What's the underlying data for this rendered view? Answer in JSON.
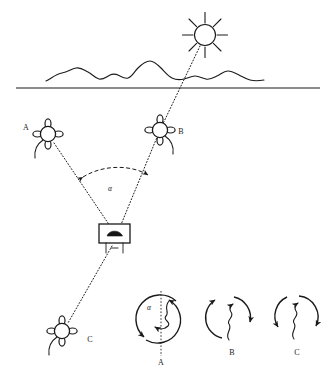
{
  "figure": {
    "background_color": "#ffffff",
    "ink_color": "#1a1a1a",
    "width": 335,
    "height": 376
  },
  "scene": {
    "sun": {
      "name": "sun",
      "label": "",
      "cx": 205,
      "cy": 35,
      "radius": 10.5,
      "ray_count": 8,
      "ray_length": 11
    },
    "horizon": {
      "name": "horizon-line",
      "y": 88,
      "x_start": 16,
      "x_end": 320
    },
    "terrain": {
      "name": "mountain-silhouette",
      "x_start": 46,
      "x_end": 264,
      "base_y": 80
    },
    "detector": {
      "name": "detector-device",
      "label": "",
      "x": 99,
      "y": 224,
      "width": 31,
      "height": 19
    }
  },
  "organisms": [
    {
      "id": "A",
      "label": "A",
      "cx": 48,
      "cy": 134,
      "label_x": 26,
      "label_y": 130,
      "tail_dir": "left"
    },
    {
      "id": "B",
      "label": "B",
      "cx": 160,
      "cy": 130,
      "label_x": 180,
      "label_y": 134,
      "tail_dir": "right"
    },
    {
      "id": "C",
      "label": "C",
      "cx": 62,
      "cy": 331,
      "label_x": 90,
      "label_y": 342,
      "tail_dir": "left"
    }
  ],
  "rays": [
    {
      "name": "ray-sun-to-B-to-detector",
      "from": "sun",
      "through": "B",
      "to": "detector",
      "style": "dotted"
    },
    {
      "name": "ray-A-to-detector",
      "from": "A",
      "to": "detector",
      "style": "dotted"
    },
    {
      "name": "ray-detector-to-C",
      "from": "detector",
      "to": "C",
      "style": "dotted"
    }
  ],
  "angle_arc": {
    "name": "angle-alpha-arc",
    "label": "α",
    "label_x": 110,
    "label_y": 191,
    "style": "dashed",
    "arrowheads": "both"
  },
  "bottom_panels": [
    {
      "id": "A",
      "label": "A",
      "cx": 161,
      "cy": 320,
      "radius": 22,
      "alpha_label": "α",
      "alpha_x": 148,
      "alpha_y": 309,
      "has_axis": true,
      "axis_label": "A",
      "axis_label_x": 161,
      "axis_label_y": 364,
      "label_x": 161,
      "label_y": 364
    },
    {
      "id": "B",
      "label": "B",
      "cx": 232,
      "cy": 318,
      "radius": 22,
      "alpha_label": "",
      "has_axis": false,
      "label_x": 232,
      "label_y": 354
    },
    {
      "id": "C",
      "label": "C",
      "cx": 297,
      "cy": 318,
      "radius": 22,
      "alpha_label": "",
      "has_axis": false,
      "label_x": 297,
      "label_y": 354
    }
  ],
  "symbols": {
    "alpha": "α"
  }
}
